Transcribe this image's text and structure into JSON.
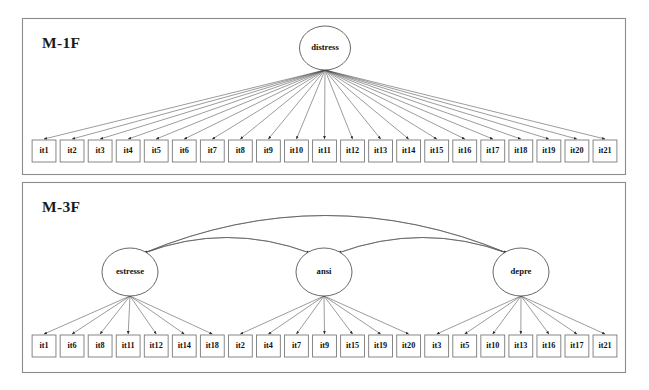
{
  "figure": {
    "background_color": "#ffffff",
    "line_color": "#4a4a4a",
    "border_color": "#8c8c8c"
  },
  "panels": [
    {
      "id": "m1f",
      "title": "M-1F",
      "factors": [
        {
          "id": "distress",
          "label": "distress"
        }
      ],
      "items": [
        "it1",
        "it2",
        "it3",
        "it4",
        "it5",
        "it6",
        "it7",
        "it8",
        "it9",
        "it10",
        "it11",
        "it12",
        "it13",
        "it14",
        "it15",
        "it16",
        "it17",
        "it18",
        "it19",
        "it20",
        "it21"
      ],
      "loadings": [
        {
          "from": "distress",
          "to": [
            "it1",
            "it2",
            "it3",
            "it4",
            "it5",
            "it6",
            "it7",
            "it8",
            "it9",
            "it10",
            "it11",
            "it12",
            "it13",
            "it14",
            "it15",
            "it16",
            "it17",
            "it18",
            "it19",
            "it20",
            "it21"
          ]
        }
      ],
      "correlations": []
    },
    {
      "id": "m3f",
      "title": "M-3F",
      "factors": [
        {
          "id": "estresse",
          "label": "estresse"
        },
        {
          "id": "ansi",
          "label": "ansi"
        },
        {
          "id": "depre",
          "label": "depre"
        }
      ],
      "items": [
        "it1",
        "it6",
        "it8",
        "it11",
        "it12",
        "it14",
        "it18",
        "it2",
        "it4",
        "it7",
        "it9",
        "it15",
        "it19",
        "it20",
        "it3",
        "it5",
        "it10",
        "it13",
        "it16",
        "it17",
        "it21"
      ],
      "loadings": [
        {
          "from": "estresse",
          "to": [
            "it1",
            "it6",
            "it8",
            "it11",
            "it12",
            "it14",
            "it18"
          ]
        },
        {
          "from": "ansi",
          "to": [
            "it2",
            "it4",
            "it7",
            "it9",
            "it15",
            "it19",
            "it20"
          ]
        },
        {
          "from": "depre",
          "to": [
            "it3",
            "it5",
            "it10",
            "it13",
            "it16",
            "it17",
            "it21"
          ]
        }
      ],
      "correlations": [
        {
          "between": [
            "estresse",
            "ansi"
          ]
        },
        {
          "between": [
            "ansi",
            "depre"
          ]
        },
        {
          "between": [
            "estresse",
            "depre"
          ]
        }
      ]
    }
  ],
  "chart_data": {
    "type": "diagram",
    "diagram_kind": "confirmatory-factor-analysis-path-diagram",
    "title": "",
    "models": [
      {
        "name": "M-1F",
        "n_factors": 1,
        "factor_names": [
          "distress"
        ],
        "n_indicators": 21,
        "indicator_names": [
          "it1",
          "it2",
          "it3",
          "it4",
          "it5",
          "it6",
          "it7",
          "it8",
          "it9",
          "it10",
          "it11",
          "it12",
          "it13",
          "it14",
          "it15",
          "it16",
          "it17",
          "it18",
          "it19",
          "it20",
          "it21"
        ],
        "factor_correlations": []
      },
      {
        "name": "M-3F",
        "n_factors": 3,
        "factor_names": [
          "estresse",
          "ansi",
          "depre"
        ],
        "n_indicators": 21,
        "indicator_names": [
          "it1",
          "it6",
          "it8",
          "it11",
          "it12",
          "it14",
          "it18",
          "it2",
          "it4",
          "it7",
          "it9",
          "it15",
          "it19",
          "it20",
          "it3",
          "it5",
          "it10",
          "it13",
          "it16",
          "it17",
          "it21"
        ],
        "factor_indicator_map": {
          "estresse": [
            "it1",
            "it6",
            "it8",
            "it11",
            "it12",
            "it14",
            "it18"
          ],
          "ansi": [
            "it2",
            "it4",
            "it7",
            "it9",
            "it15",
            "it19",
            "it20"
          ],
          "depre": [
            "it3",
            "it5",
            "it10",
            "it13",
            "it16",
            "it17",
            "it21"
          ]
        },
        "factor_correlations": [
          [
            "estresse",
            "ansi"
          ],
          [
            "ansi",
            "depre"
          ],
          [
            "estresse",
            "depre"
          ]
        ]
      }
    ]
  }
}
